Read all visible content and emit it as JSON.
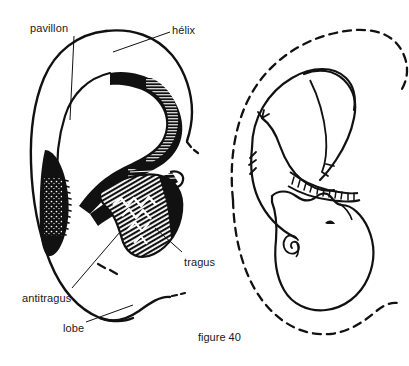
{
  "figure": {
    "caption": "figure 40",
    "caption_pos": {
      "x": 198,
      "y": 331
    },
    "stroke_color": "#111111",
    "fill_color": "#111111",
    "background_color": "#ffffff",
    "width": 409,
    "height": 366
  },
  "labels": [
    {
      "id": "pavillon",
      "text": "pavillon",
      "x": 30,
      "y": 22,
      "leader_from": {
        "x": 74,
        "y": 36
      },
      "leader_to": {
        "x": 70,
        "y": 120
      },
      "points_to": "outer-ear-auricle"
    },
    {
      "id": "helix",
      "text": "hélix",
      "x": 172,
      "y": 24,
      "leader_from": {
        "x": 170,
        "y": 36
      },
      "leader_to": {
        "x": 113,
        "y": 52
      },
      "points_to": "helix-rim"
    },
    {
      "id": "tragus",
      "text": "tragus",
      "x": 184,
      "y": 258,
      "leader_from": {
        "x": 182,
        "y": 256
      },
      "leader_to": {
        "x": 155,
        "y": 228
      },
      "points_to": "tragus-shape"
    },
    {
      "id": "antitragus",
      "text": "antitragus",
      "x": 22,
      "y": 295,
      "leader_from": {
        "x": 72,
        "y": 292
      },
      "leader_to": {
        "x": 120,
        "y": 232
      },
      "points_to": "antitragus-shape"
    },
    {
      "id": "lobe",
      "text": "lobe",
      "x": 63,
      "y": 325,
      "leader_from": {
        "x": 86,
        "y": 325
      },
      "leader_to": {
        "x": 133,
        "y": 305
      },
      "points_to": "ear-lobe"
    }
  ],
  "diagram_left": {
    "name": "human-ear-anatomy",
    "description": "Line drawing of a human outer ear with shaded antihelix and hatched tragus-antitragus region"
  },
  "diagram_right": {
    "name": "fetus-in-ear-outline",
    "description": "Line drawing of a curled fetus superimposed on a dashed outline of an ear"
  }
}
